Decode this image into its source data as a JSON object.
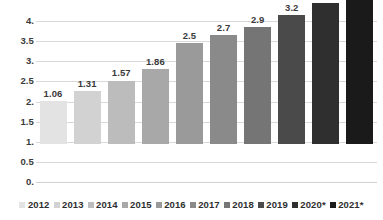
{
  "chart_data": {
    "type": "bar",
    "title": "",
    "subtitle": "",
    "xlabel": "",
    "ylabel": "",
    "categories": [
      "2012",
      "2013",
      "2014",
      "2015",
      "2016",
      "2017",
      "2018",
      "2019",
      "2020*",
      "2021*"
    ],
    "values": [
      1.06,
      1.31,
      1.57,
      1.86,
      2.5,
      2.7,
      2.9,
      3.2,
      3.5,
      3.8
    ],
    "data_labels": [
      "1.06",
      "1.31",
      "1.57",
      "1.86",
      "2.5",
      "2.7",
      "2.9",
      "3.2",
      "3.5",
      "3.8"
    ],
    "bar_colors": [
      "#e3e3e3",
      "#d2d2d2",
      "#bcbcbc",
      "#a8a8a8",
      "#9a9a9a",
      "#8a8a8a",
      "#757575",
      "#4a4a4a",
      "#2f2f2f",
      "#1a1a1a"
    ],
    "ylim": [
      0,
      4
    ],
    "ytick_values": [
      0,
      0.5,
      1,
      1.5,
      2,
      2.5,
      3,
      3.5,
      4
    ],
    "ytick_labels": [
      "0.",
      "0.5",
      "1.",
      "1.5",
      "2.",
      "2.5",
      "3.",
      "3.5",
      "4."
    ],
    "grid": true,
    "grid_axis": "y",
    "legend_position": "bottom",
    "legend_entries": [
      {
        "label": "2012",
        "color": "#e3e3e3"
      },
      {
        "label": "2013",
        "color": "#d2d2d2"
      },
      {
        "label": "2014",
        "color": "#bcbcbc"
      },
      {
        "label": "2015",
        "color": "#a8a8a8"
      },
      {
        "label": "2016",
        "color": "#9a9a9a"
      },
      {
        "label": "2017",
        "color": "#8a8a8a"
      },
      {
        "label": "2018",
        "color": "#757575"
      },
      {
        "label": "2019",
        "color": "#4a4a4a"
      },
      {
        "label": "2020*",
        "color": "#2f2f2f"
      },
      {
        "label": "2021*",
        "color": "#1a1a1a"
      }
    ],
    "annotations": []
  },
  "style": {
    "background": "#ffffff",
    "gridline_color": "#d9d9d9",
    "text_color": "#3a3a3a"
  }
}
